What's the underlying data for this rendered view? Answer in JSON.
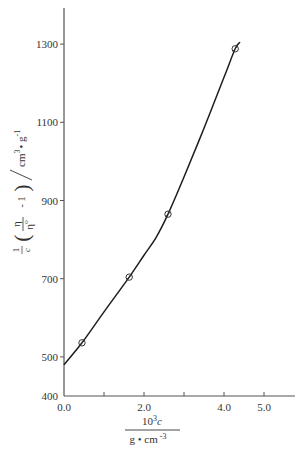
{
  "chart_data": {
    "type": "line",
    "title": "",
    "xlabel": "10^3 c / g • cm^-3",
    "ylabel": "1/c (η/η₀ − 1) / cm³•g⁻¹",
    "xlim": [
      0.0,
      5.8
    ],
    "ylim": [
      400,
      1380
    ],
    "x_ticks": [
      0.0,
      1.0,
      2.0,
      3.0,
      4.0,
      5.0
    ],
    "x_tick_labels": [
      "0.0",
      "",
      "2.0",
      "",
      "4.0",
      "5.0"
    ],
    "y_ticks": [
      400,
      500,
      700,
      900,
      1100,
      1300
    ],
    "y_tick_labels": [
      "400",
      "500",
      "700",
      "900",
      "1100",
      "1300"
    ],
    "grid": false,
    "legend": null,
    "series": [
      {
        "name": "measured",
        "marker": "open-circle",
        "points": [
          {
            "x": 0.45,
            "y": 536
          },
          {
            "x": 1.63,
            "y": 704
          },
          {
            "x": 2.6,
            "y": 865
          },
          {
            "x": 4.28,
            "y": 1288
          }
        ]
      },
      {
        "name": "fitted-curve",
        "marker": "none",
        "points": [
          {
            "x": 0.0,
            "y": 480
          },
          {
            "x": 0.45,
            "y": 536
          },
          {
            "x": 1.0,
            "y": 615
          },
          {
            "x": 1.63,
            "y": 704
          },
          {
            "x": 2.0,
            "y": 760
          },
          {
            "x": 2.3,
            "y": 805
          },
          {
            "x": 2.6,
            "y": 865
          },
          {
            "x": 3.0,
            "y": 960
          },
          {
            "x": 3.5,
            "y": 1085
          },
          {
            "x": 4.0,
            "y": 1215
          },
          {
            "x": 4.28,
            "y": 1288
          },
          {
            "x": 4.4,
            "y": 1305
          }
        ]
      }
    ]
  },
  "axes": {
    "x_label_numerator": "10",
    "x_label_exp": "3",
    "x_label_var": "c",
    "x_label_denominator": "g • cm",
    "x_label_denominator_exp": "-3",
    "y_label_prefix_num": "1",
    "y_label_prefix_den": "c",
    "y_label_eta": "η",
    "y_label_eta0": "η",
    "y_label_eta0_sub": "o",
    "y_label_minus_one": "- 1",
    "y_label_units": "cm",
    "y_label_units_exp": "3",
    "y_label_units_rest": "• g",
    "y_label_units_rest_exp": "-1"
  }
}
